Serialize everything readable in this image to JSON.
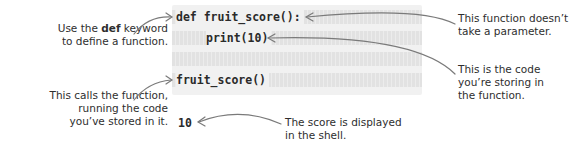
{
  "annotations": {
    "def_keyword": {
      "prefix": "Use the ",
      "keyword": "def",
      "suffix": " keyword",
      "line2": "to define a function."
    },
    "no_parameter": {
      "line1": "This function doesn’t",
      "line2": "take a parameter."
    },
    "stored_code": {
      "line1": "This is the code",
      "line2": "you’re storing in",
      "line3": "the function."
    },
    "calls_function": {
      "line1": "This calls the function,",
      "line2": "running the code",
      "line3": "you’ve stored in it."
    },
    "score_displayed": {
      "line1": "The score is displayed",
      "line2": "in the shell."
    }
  },
  "code": {
    "lines": [
      "def fruit_score():",
      "print(10)",
      "",
      "fruit_score()"
    ]
  },
  "shell_output": "10",
  "colors": {
    "code_bg": "#f1f1f1",
    "arrow": "#7a7a7a",
    "text": "#2e2e2e"
  }
}
